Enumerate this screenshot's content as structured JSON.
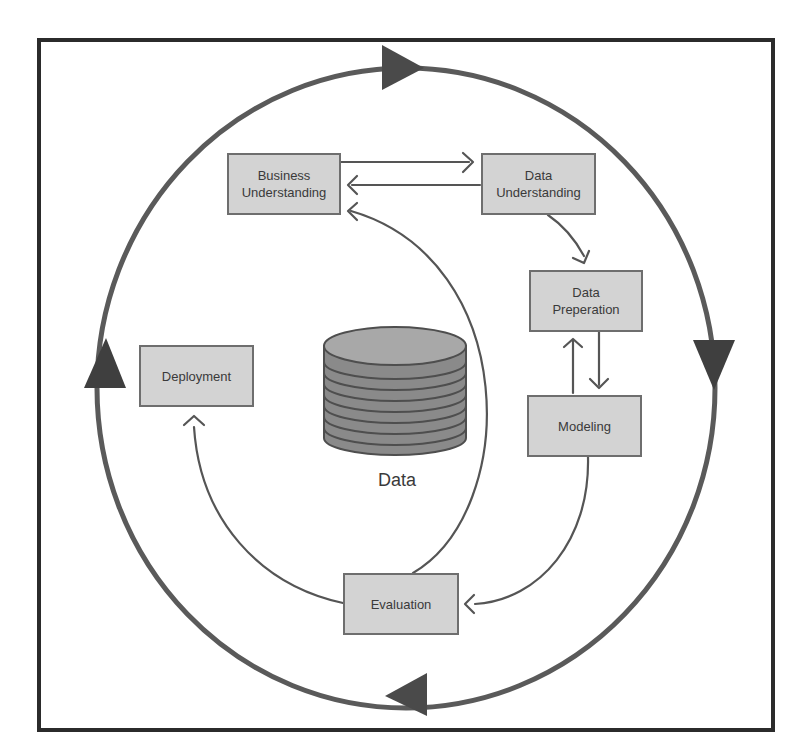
{
  "diagram": {
    "colors": {
      "frame": "#2b2b2b",
      "outer_cycle": "#5a5a5a",
      "arrow_head": "#4a4a4a",
      "connector": "#555555",
      "box_fill": "#d3d3d3",
      "box_border": "#6e6e6e",
      "text": "#3a3a3a",
      "cylinder_top": "#a8a8a8",
      "cylinder_body": "#8a8a8a"
    },
    "nodes": {
      "business_understanding": "Business\nUnderstanding",
      "data_understanding": "Data\nUnderstanding",
      "data_preparation": "Data\nPreperation",
      "modeling": "Modeling",
      "evaluation": "Evaluation",
      "deployment": "Deployment"
    },
    "center": {
      "icon": "database-cylinder-icon",
      "label": "Data"
    },
    "edges": [
      {
        "from": "Business Understanding",
        "to": "Data Understanding"
      },
      {
        "from": "Data Understanding",
        "to": "Business Understanding"
      },
      {
        "from": "Data Understanding",
        "to": "Data Preperation"
      },
      {
        "from": "Data Preperation",
        "to": "Modeling"
      },
      {
        "from": "Modeling",
        "to": "Data Preperation"
      },
      {
        "from": "Modeling",
        "to": "Evaluation"
      },
      {
        "from": "Evaluation",
        "to": "Business Understanding"
      },
      {
        "from": "Evaluation",
        "to": "Deployment"
      }
    ],
    "outer_cycle": {
      "direction": "clockwise",
      "arrowheads": [
        "top",
        "right",
        "bottom",
        "left"
      ]
    }
  }
}
